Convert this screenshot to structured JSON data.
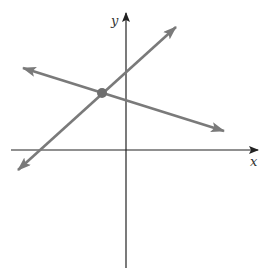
{
  "diagram": {
    "type": "coordinate-plane",
    "axes": {
      "x_label": "x",
      "y_label": "y",
      "color": "#222222"
    },
    "lines": [
      {
        "name": "increasing-line",
        "slope_sign": "positive",
        "color": "#7a7a7a"
      },
      {
        "name": "decreasing-line",
        "slope_sign": "negative",
        "color": "#7a7a7a"
      }
    ],
    "intersection_point": {
      "color": "#6e6e6e",
      "quadrant": "II"
    }
  }
}
